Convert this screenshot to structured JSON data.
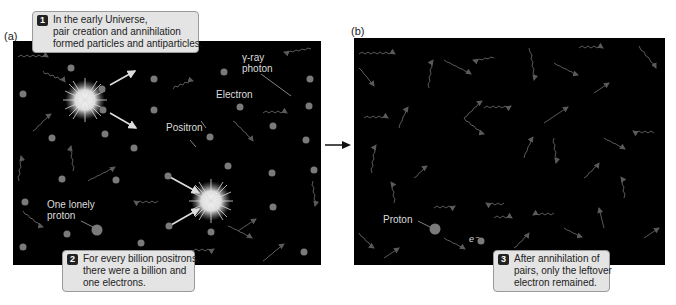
{
  "panel_a": {
    "label": "(a)",
    "caption1": {
      "number": "1",
      "lines": [
        "In the early Universe,",
        "pair creation and annihilation",
        "formed particles and antiparticles."
      ]
    },
    "caption2": {
      "number": "2",
      "lines": [
        "For every billion positrons,",
        "there were a billion and",
        "one electrons."
      ]
    },
    "labels": {
      "gamma_ray": [
        "γ-ray",
        "photon"
      ],
      "electron": "Electron",
      "positron": "Positron",
      "proton": [
        "One lonely",
        "proton"
      ]
    }
  },
  "panel_b": {
    "label": "(b)",
    "caption3": {
      "number": "3",
      "lines": [
        "After annihilation of",
        "pairs, only the leftover",
        "electron remained."
      ]
    },
    "labels": {
      "proton": "Proton",
      "electron_symbol": "e⁻"
    }
  },
  "colors": {
    "background": "#000000",
    "particle": "#7a7a7a",
    "photon": "#5a5a5a",
    "caption_bg": "#e4e4e4",
    "label_text": "#dddddd"
  }
}
